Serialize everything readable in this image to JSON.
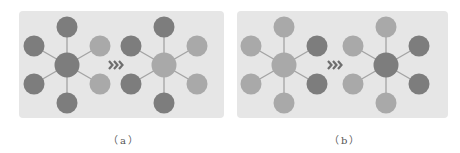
{
  "colors": {
    "dark": "#7d7d7d",
    "light": "#a9a9a9",
    "edge": "#a3a3a3",
    "panel_bg": "#e6e6e6",
    "arrow": "#6e6e6e"
  },
  "arrow_icon": "triple-chevron-right",
  "panels": [
    {
      "id": "a",
      "caption": "（a）",
      "graphs": [
        {
          "center": "dark",
          "top": "dark",
          "upper_left": "dark",
          "lower_left": "dark",
          "bottom": "dark",
          "upper_right": "light",
          "lower_right": "light"
        },
        {
          "center": "light",
          "top": "dark",
          "upper_left": "dark",
          "lower_left": "dark",
          "bottom": "dark",
          "upper_right": "light",
          "lower_right": "light"
        }
      ]
    },
    {
      "id": "b",
      "caption": "（b）",
      "graphs": [
        {
          "center": "light",
          "top": "light",
          "upper_left": "light",
          "lower_left": "light",
          "bottom": "light",
          "upper_right": "dark",
          "lower_right": "dark"
        },
        {
          "center": "dark",
          "top": "light",
          "upper_left": "light",
          "lower_left": "light",
          "bottom": "light",
          "upper_right": "dark",
          "lower_right": "dark"
        }
      ]
    }
  ]
}
